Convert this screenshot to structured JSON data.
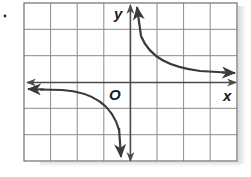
{
  "problem": {
    "marker": "."
  },
  "graph": {
    "type": "hyperbola / rational function graph",
    "axes": {
      "x_label": "x",
      "y_label": "y",
      "origin_label": "O"
    },
    "grid": {
      "columns": 8,
      "rows": 6,
      "x_range_units": [
        -4,
        4
      ],
      "y_range_units": [
        -3,
        3
      ],
      "line_color": "#8a8a8a",
      "border_color": "#6e6e6e"
    },
    "curves": [
      {
        "name": "upper-right branch",
        "quadrant": "I",
        "description": "approaches y-axis upward and x-axis rightward",
        "color": "#3a3a3a"
      },
      {
        "name": "lower-left branch",
        "quadrant": "III",
        "description": "approaches x-axis leftward and y-axis downward",
        "color": "#3a3a3a"
      }
    ],
    "axis_color": "#4a4a4a"
  }
}
